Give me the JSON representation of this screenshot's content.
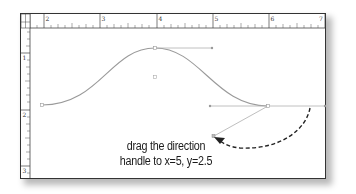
{
  "diagram": {
    "type": "bezier-curve-editor",
    "top_ruler": {
      "labels": [
        "2",
        "3",
        "4",
        "5",
        "6",
        "7"
      ]
    },
    "left_ruler": {
      "labels": [
        "1",
        "2",
        "3"
      ]
    },
    "curve": {
      "description": "bell-shaped bezier path with anchor points and direction handles",
      "stroke_color": "#9a9a9a",
      "handle_color": "#b0b0b0"
    },
    "annotation": {
      "line1": "drag the direction",
      "line2": "handle to x=5, y=2.5",
      "arrow_style": "dashed",
      "arrow_color": "#222222"
    }
  }
}
